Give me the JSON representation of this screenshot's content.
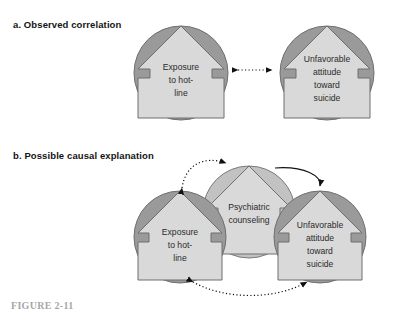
{
  "figure": {
    "caption": "FIGURE 2-11",
    "panels": [
      {
        "id": "a",
        "label": "a. Observed correlation",
        "nodes": [
          {
            "id": "exposure",
            "lines": [
              "Exposure",
              "to hot-",
              "line"
            ]
          },
          {
            "id": "attitude",
            "lines": [
              "Unfavorable",
              "attitude",
              "toward",
              "suicide"
            ]
          }
        ],
        "connectors": [
          {
            "id": "correlation-link",
            "style": "dotted",
            "arrowheads": "both",
            "shape": "straight"
          }
        ]
      },
      {
        "id": "b",
        "label": "b. Possible causal explanation",
        "nodes": [
          {
            "id": "exposure",
            "lines": [
              "Exposure",
              "to hot-",
              "line"
            ]
          },
          {
            "id": "counseling",
            "lines": [
              "Psychiatric",
              "counseling"
            ]
          },
          {
            "id": "attitude",
            "lines": [
              "Unfavorable",
              "attitude",
              "toward",
              "suicide"
            ]
          }
        ],
        "connectors": [
          {
            "id": "exposure-counseling-link",
            "style": "dotted",
            "arrowheads": "both",
            "shape": "arc-top-left"
          },
          {
            "id": "counseling-attitude-link",
            "style": "solid",
            "arrowheads": "end",
            "shape": "arc-top-right"
          },
          {
            "id": "exposure-attitude-link",
            "style": "dotted",
            "arrowheads": "both",
            "shape": "arc-bottom"
          }
        ]
      }
    ]
  },
  "colors": {
    "circle_dark": "#9a9a9a",
    "circle_light": "#c2c2c2",
    "house_fill": "#d9d9d9",
    "outline": "#6b6b6b",
    "text": "#2b2b2b",
    "connector": "#111111",
    "background": "#ffffff"
  }
}
